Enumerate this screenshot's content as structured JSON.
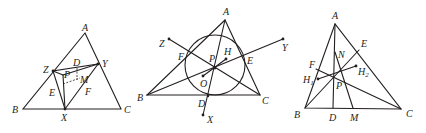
{
  "figures": [
    {
      "id": "figure-1",
      "labels": {
        "A": "A",
        "B": "B",
        "C": "C",
        "X": "X",
        "Y": "Y",
        "Z": "Z",
        "D": "D",
        "E": "E",
        "F": "F",
        "P": "P",
        "M": "M"
      }
    },
    {
      "id": "figure-2",
      "labels": {
        "A": "A",
        "B": "B",
        "C": "C",
        "D": "D",
        "E": "E",
        "F": "F",
        "P": "P",
        "H": "H",
        "O": "O",
        "X": "X",
        "Y": "Y",
        "Z": "Z"
      }
    },
    {
      "id": "figure-3",
      "labels": {
        "A": "A",
        "B": "B",
        "C": "C",
        "D": "D",
        "M": "M",
        "E": "E",
        "F": "F",
        "N": "N",
        "P": "P",
        "H1": "H",
        "H1_sub": "1",
        "H2": "H",
        "H2_sub": "2"
      }
    }
  ],
  "colors": {
    "ink": "#231f20",
    "background": "#ffffff"
  }
}
